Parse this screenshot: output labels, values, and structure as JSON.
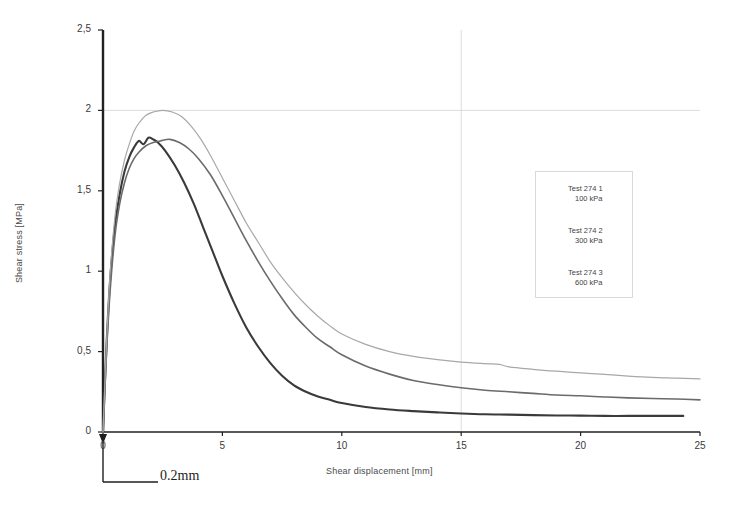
{
  "chart_data": {
    "type": "line",
    "title": "",
    "xlabel": "Shear displacement [mm]",
    "ylabel": "Shear stress [MPa]",
    "xlim": [
      0,
      25
    ],
    "ylim": [
      0,
      2.5
    ],
    "xticks": [
      "0",
      "5",
      "10",
      "15",
      "20",
      "25"
    ],
    "xtick_values": [
      0,
      5,
      10,
      15,
      20,
      25
    ],
    "yticks": [
      "0",
      "0,5",
      "1",
      "1,5",
      "2",
      "2,5"
    ],
    "ytick_values": [
      0,
      0.5,
      1,
      1.5,
      2,
      2.5
    ],
    "grid": "major gridlines at y=2.0 (horizontal, faint) and x=15 (vertical, faint)",
    "gridlines": {
      "horizontal": [
        2.0
      ],
      "vertical": [
        15
      ]
    },
    "legend_position": "right-middle",
    "annotation": "0.2mm",
    "annotation_meaning": "vertical-offset-scale-marker-at-origin",
    "series": [
      {
        "name": "Test 274 1",
        "label_line1": "Test 274 1",
        "label_line2": "100 kPa",
        "confining_pressure_kpa": 100,
        "color": "#3a3a3a",
        "width": 2.1,
        "peak_x": 1.9,
        "peak_y": 1.83,
        "residual_y": 0.1,
        "x": [
          0.0,
          0.15,
          0.3,
          0.5,
          0.7,
          0.9,
          1.1,
          1.3,
          1.5,
          1.7,
          1.9,
          2.1,
          2.3,
          2.6,
          3.0,
          3.4,
          3.8,
          4.2,
          4.6,
          5.0,
          5.5,
          6.0,
          6.5,
          7.0,
          7.5,
          8.0,
          8.5,
          9.0,
          9.5,
          10.0,
          11.0,
          12.0,
          13.0,
          14.0,
          15.0,
          16.0,
          17.0,
          18.0,
          19.0,
          20.0,
          21.0,
          22.0,
          23.0,
          24.3
        ],
        "y": [
          0.0,
          0.55,
          0.95,
          1.28,
          1.48,
          1.62,
          1.71,
          1.77,
          1.81,
          1.79,
          1.83,
          1.82,
          1.8,
          1.75,
          1.66,
          1.55,
          1.42,
          1.27,
          1.12,
          0.97,
          0.8,
          0.65,
          0.53,
          0.43,
          0.35,
          0.29,
          0.25,
          0.22,
          0.2,
          0.18,
          0.155,
          0.14,
          0.13,
          0.122,
          0.115,
          0.11,
          0.108,
          0.105,
          0.103,
          0.102,
          0.1,
          0.1,
          0.1,
          0.1
        ]
      },
      {
        "name": "Test 274 2",
        "label_line1": "Test 274 2",
        "label_line2": "300 kPa",
        "confining_pressure_kpa": 300,
        "color": "#6b6b6b",
        "width": 1.6,
        "peak_x": 2.8,
        "peak_y": 1.82,
        "residual_y": 0.2,
        "x": [
          0.0,
          0.15,
          0.3,
          0.5,
          0.7,
          0.9,
          1.1,
          1.3,
          1.5,
          1.8,
          2.1,
          2.4,
          2.8,
          3.2,
          3.6,
          4.0,
          4.5,
          5.0,
          5.5,
          6.0,
          6.5,
          7.0,
          7.5,
          8.0,
          8.5,
          9.0,
          9.5,
          10.0,
          11.0,
          12.0,
          13.0,
          14.0,
          15.0,
          16.0,
          17.0,
          18.0,
          19.0,
          20.0,
          21.0,
          22.0,
          23.0,
          24.0,
          25.0
        ],
        "y": [
          0.0,
          0.5,
          0.88,
          1.22,
          1.42,
          1.55,
          1.64,
          1.7,
          1.74,
          1.78,
          1.8,
          1.81,
          1.82,
          1.8,
          1.76,
          1.7,
          1.6,
          1.47,
          1.33,
          1.19,
          1.06,
          0.94,
          0.83,
          0.73,
          0.65,
          0.58,
          0.53,
          0.48,
          0.41,
          0.36,
          0.32,
          0.295,
          0.275,
          0.26,
          0.25,
          0.24,
          0.23,
          0.225,
          0.218,
          0.212,
          0.208,
          0.205,
          0.2
        ]
      },
      {
        "name": "Test 274 3",
        "label_line1": "Test 274 3",
        "label_line2": "600 kPa",
        "confining_pressure_kpa": 600,
        "color": "#a8a8a8",
        "width": 1.2,
        "peak_x": 2.5,
        "peak_y": 2.0,
        "residual_y": 0.33,
        "x": [
          0.0,
          0.15,
          0.3,
          0.5,
          0.7,
          0.9,
          1.1,
          1.3,
          1.5,
          1.8,
          2.1,
          2.5,
          2.9,
          3.3,
          3.7,
          4.1,
          4.5,
          5.0,
          5.5,
          6.0,
          6.5,
          7.0,
          7.5,
          8.0,
          8.5,
          9.0,
          9.5,
          10.0,
          11.0,
          12.0,
          13.0,
          14.0,
          15.0,
          16.0,
          16.6,
          17.0,
          18.0,
          19.0,
          20.0,
          21.0,
          22.0,
          23.0,
          24.0,
          25.0
        ],
        "y": [
          0.0,
          0.56,
          0.99,
          1.34,
          1.55,
          1.69,
          1.79,
          1.87,
          1.92,
          1.97,
          1.99,
          2.0,
          1.99,
          1.96,
          1.9,
          1.82,
          1.72,
          1.58,
          1.44,
          1.3,
          1.18,
          1.06,
          0.96,
          0.87,
          0.79,
          0.72,
          0.66,
          0.61,
          0.545,
          0.5,
          0.47,
          0.45,
          0.435,
          0.425,
          0.42,
          0.405,
          0.39,
          0.378,
          0.368,
          0.358,
          0.348,
          0.34,
          0.335,
          0.33
        ]
      }
    ]
  },
  "annotations": {
    "scale_marker_label": "0.2mm"
  }
}
